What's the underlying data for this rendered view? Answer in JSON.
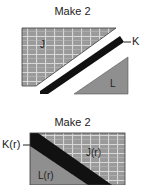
{
  "top": {
    "title": "Make 2",
    "labels": {
      "j": "J",
      "k": "K",
      "l": "L"
    }
  },
  "bottom": {
    "title": "Make 2",
    "labels": {
      "j": "J(r)",
      "k": "K(r)",
      "l": "L(r)"
    }
  },
  "colors": {
    "grid_fill": "#9a9a9a",
    "grid_line": "#d8d8d8",
    "grid_border": "#3a3a3a",
    "strip": "#111111",
    "solid_fill": "#8f8f8f"
  }
}
